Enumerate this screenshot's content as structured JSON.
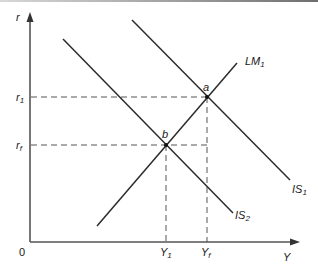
{
  "diagram": {
    "type": "IS-LM model",
    "axes": {
      "y_label": "r",
      "x_label": "Y",
      "origin_label": "0"
    },
    "curves": [
      {
        "id": "LM1",
        "label": "LM",
        "subscript": "1",
        "slope": "upward"
      },
      {
        "id": "IS1",
        "label": "IS",
        "subscript": "1",
        "slope": "downward"
      },
      {
        "id": "IS2",
        "label": "IS",
        "subscript": "2",
        "slope": "downward"
      }
    ],
    "points": [
      {
        "id": "a",
        "label": "a",
        "intersection": [
          "LM1",
          "IS1"
        ]
      },
      {
        "id": "b",
        "label": "b",
        "intersection": [
          "LM1",
          "IS2"
        ]
      }
    ],
    "y_ticks": [
      {
        "label": "r",
        "subscript": "1"
      },
      {
        "label": "r",
        "subscript": "f"
      }
    ],
    "x_ticks": [
      {
        "label": "Y",
        "subscript": "1"
      },
      {
        "label": "Y",
        "subscript": "f"
      }
    ],
    "colors": {
      "line": "#2b2b2b",
      "axis": "#555555",
      "dashed": "#555555"
    }
  }
}
